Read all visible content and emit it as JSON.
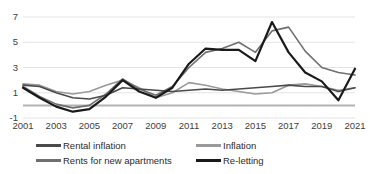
{
  "chart_data": {
    "type": "line",
    "title": "",
    "xlabel": "",
    "ylabel": "",
    "x": [
      2001,
      2002,
      2003,
      2004,
      2005,
      2006,
      2007,
      2008,
      2009,
      2010,
      2011,
      2012,
      2013,
      2014,
      2015,
      2016,
      2017,
      2018,
      2019,
      2020,
      2021
    ],
    "xticks": [
      "2001",
      "2003",
      "2005",
      "2007",
      "2009",
      "2011",
      "2013",
      "2015",
      "2017",
      "2019",
      "2021"
    ],
    "yticks": [
      "7",
      "5",
      "3",
      "1",
      "-1"
    ],
    "ylim": [
      -1,
      7
    ],
    "xlim": [
      2001,
      2021
    ],
    "grid": true,
    "legend_position": "bottom",
    "series": [
      {
        "name": "Rental inflation",
        "color": "#4a4a4a",
        "width": 1.6,
        "values": [
          1.6,
          1.5,
          1.0,
          0.6,
          0.5,
          0.8,
          1.4,
          1.3,
          1.2,
          1.1,
          1.2,
          1.3,
          1.2,
          1.3,
          1.4,
          1.5,
          1.6,
          1.5,
          1.5,
          1.1,
          1.4
        ]
      },
      {
        "name": "Rents for new apartments",
        "color": "#6f6f6f",
        "width": 1.6,
        "values": [
          1.5,
          0.7,
          0.1,
          -0.2,
          0.0,
          0.9,
          2.1,
          1.3,
          0.8,
          1.5,
          3.0,
          4.2,
          4.5,
          5.0,
          4.2,
          5.9,
          6.2,
          4.3,
          3.0,
          2.6,
          2.4
        ]
      },
      {
        "name": "Inflation",
        "color": "#9a9a9a",
        "width": 1.6,
        "values": [
          1.7,
          1.6,
          1.1,
          0.9,
          1.1,
          1.6,
          2.0,
          1.4,
          0.6,
          1.0,
          1.8,
          1.6,
          1.3,
          1.1,
          0.9,
          1.0,
          1.6,
          1.7,
          1.5,
          1.2,
          1.4
        ]
      },
      {
        "name": "Re-letting",
        "color": "#1a1a1a",
        "width": 2.2,
        "values": [
          1.4,
          0.6,
          -0.1,
          -0.5,
          -0.3,
          0.7,
          2.0,
          1.1,
          0.6,
          1.4,
          3.3,
          4.5,
          4.4,
          4.4,
          3.5,
          6.6,
          4.2,
          2.6,
          1.9,
          0.4,
          2.9
        ]
      }
    ],
    "axis": {
      "zero_line_value": 0,
      "zero_line_color": "#b3b3b3",
      "grid_color": "#e4e4e4"
    }
  },
  "plot_geometry": {
    "left": 23,
    "right": 355,
    "top": 17,
    "bottom": 118
  }
}
